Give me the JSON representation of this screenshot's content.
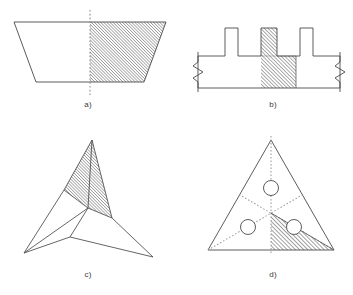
{
  "figure": {
    "background_color": "#ffffff",
    "line_color": "#4a4a4a",
    "hatch_color": "#6b6b6b",
    "centerline_color": "#8c8c8c",
    "label_color": "#3a3a3a",
    "stroke_width": 0.9,
    "hatch_angle_deg": 45,
    "hatch_spacing_px": 2.2
  },
  "panels": [
    {
      "id": "a",
      "label": "a)",
      "shape": "trapezoid",
      "description": "Isosceles trapezoid with wide side up, vertical dotted centerline, right half hatched",
      "label_x": 68,
      "label_y": 100,
      "geometry": {
        "top_left_x": 14,
        "top_right_x": 166,
        "bottom_left_x": 36,
        "bottom_right_x": 144,
        "top_y": 22,
        "bottom_y": 82,
        "centerline_x": 90,
        "centerline_top_y": 10,
        "centerline_bottom_y": 95
      },
      "hatched_region": "right-half"
    },
    {
      "id": "b",
      "label": "b)",
      "shape": "ribbed-profile",
      "description": "Horizontal bar with three rectangular ribs on top, zigzag break symbols at both ends, central rib and column hatched",
      "label_x": 253,
      "label_y": 100,
      "geometry": {
        "base_left_x": 198,
        "base_right_x": 340,
        "base_top_y": 56,
        "base_bottom_y": 88,
        "rib_top_y": 28,
        "ribs": [
          {
            "left_x": 225,
            "right_x": 238
          },
          {
            "left_x": 261,
            "right_x": 277
          },
          {
            "left_x": 300,
            "right_x": 313
          }
        ],
        "hatch_left_x": 261,
        "hatch_right_x": 296,
        "break_left_x": 198,
        "break_right_x": 340
      },
      "hatched_region": "center-column"
    },
    {
      "id": "c",
      "label": "c)",
      "shape": "three-blade-star",
      "description": "Three-pointed concave star (propeller) with 120 degree rotational symmetry, top blade hatched",
      "label_x": 68,
      "label_y": 270,
      "geometry": {
        "center_x": 88,
        "center_y": 208,
        "tip_top_x": 92,
        "tip_top_y": 140,
        "tip_left_x": 24,
        "tip_left_y": 253,
        "tip_right_x": 153,
        "tip_right_y": 257,
        "inner_a_x": 64,
        "inner_a_y": 190,
        "inner_b_x": 70,
        "inner_b_y": 237,
        "inner_c_x": 112,
        "inner_c_y": 218
      },
      "hatched_region": "top-blade"
    },
    {
      "id": "d",
      "label": "d)",
      "shape": "equilateral-triangle-with-holes",
      "description": "Equilateral triangle with three circular holes, dotted median symmetry lines from each vertex, one sixth sector hatched",
      "label_x": 253,
      "label_y": 270,
      "geometry": {
        "apex_x": 271,
        "apex_y": 140,
        "bottom_left_x": 208,
        "bottom_left_y": 250,
        "bottom_right_x": 334,
        "bottom_right_y": 250,
        "centroid_x": 271,
        "centroid_y": 213,
        "circle_radius": 7.5,
        "circles": [
          {
            "cx": 271,
            "cy": 188
          },
          {
            "cx": 248,
            "cy": 227
          },
          {
            "cx": 294,
            "cy": 227
          }
        ]
      },
      "hatched_region": "lower-right-sixth"
    }
  ]
}
